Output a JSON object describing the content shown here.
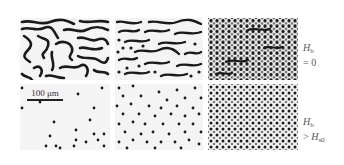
{
  "figure": {
    "rows": [
      {
        "label_symbol": "H",
        "label_sub": "b",
        "label_rest": "= 0",
        "panels": [
          {
            "pattern": "labyrinth",
            "density": "sparse-stripes"
          },
          {
            "pattern": "stripes-and-bubbles",
            "density": "mixed"
          },
          {
            "pattern": "bubbles-dense-with-stripes",
            "density": "dense"
          }
        ]
      },
      {
        "label_symbol": "H",
        "label_sub": "b",
        "label_rest_prefix": "> ",
        "label_rest_symbol": "H",
        "label_rest_sub": "s0",
        "panels": [
          {
            "pattern": "isolated-bubbles",
            "density": "very-sparse"
          },
          {
            "pattern": "isolated-bubbles",
            "density": "medium"
          },
          {
            "pattern": "bubble-lattice",
            "density": "dense"
          }
        ]
      }
    ],
    "scale_bar": {
      "text": "100 μm"
    },
    "colors": {
      "domain": "#1a1a1a",
      "background": "#f4f4f4",
      "label": "#555555"
    }
  }
}
